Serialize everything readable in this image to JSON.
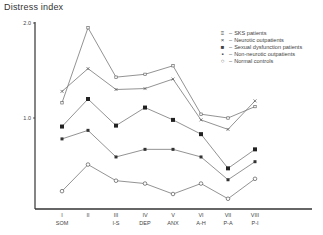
{
  "chart_data": {
    "type": "line",
    "title": "",
    "ylabel": "Distress index",
    "xlabel": "",
    "ylim": [
      0,
      2.0
    ],
    "yticks": [
      {
        "value": 2.0,
        "label": "2.0"
      },
      {
        "value": 1.0,
        "label": "1.0"
      }
    ],
    "categories": [
      "I",
      "II",
      "III",
      "IV",
      "V",
      "VI",
      "VII",
      "VIII"
    ],
    "category_sublabels": [
      "SOM",
      "",
      "I-S",
      "DEP",
      "ANX",
      "A-H",
      "P-A",
      "P-I"
    ],
    "grid": false,
    "legend_position": "top-right",
    "series": [
      {
        "name": "SKS patients",
        "marker": "double-square",
        "values": [
          1.16,
          1.95,
          1.43,
          1.46,
          1.55,
          1.04,
          1.0,
          1.12
        ]
      },
      {
        "name": "Neurotic outpatients",
        "marker": "x",
        "values": [
          1.28,
          1.52,
          1.3,
          1.31,
          1.41,
          0.98,
          0.88,
          1.18
        ]
      },
      {
        "name": "Sexual dysfunction patients",
        "marker": "filled-square",
        "values": [
          0.91,
          1.2,
          0.92,
          1.11,
          0.98,
          0.83,
          0.47,
          0.67
        ]
      },
      {
        "name": "Non-neurotic outpatients",
        "marker": "filled-small-square",
        "values": [
          0.78,
          0.87,
          0.59,
          0.67,
          0.67,
          0.59,
          0.35,
          0.54
        ]
      },
      {
        "name": "Normal controls",
        "marker": "open-circle",
        "values": [
          0.23,
          0.51,
          0.34,
          0.31,
          0.2,
          0.31,
          0.15,
          0.36
        ]
      }
    ]
  },
  "legend": [
    {
      "symbol": "≡",
      "label": "SKS patients"
    },
    {
      "symbol": "×",
      "label": "Neurotic outpatients"
    },
    {
      "symbol": "■",
      "label": "Sexual dysfunction patients"
    },
    {
      "symbol": "▪",
      "label": "Non-neurotic outpatients"
    },
    {
      "symbol": "○",
      "label": "Normal controls"
    }
  ],
  "colors": {
    "line": "#777777",
    "axis": "#333333",
    "text": "#444444"
  }
}
